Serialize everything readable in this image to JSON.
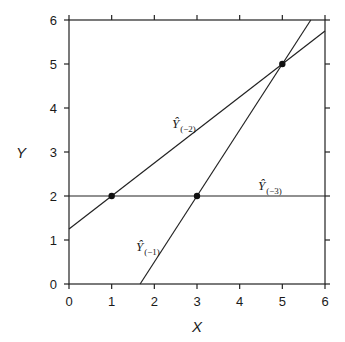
{
  "chart_data": {
    "type": "line",
    "title": "",
    "xlabel": "X",
    "ylabel": "Y",
    "xlim": [
      0,
      6
    ],
    "ylim": [
      0,
      6
    ],
    "x_ticks": [
      "0",
      "1",
      "2",
      "3",
      "4",
      "5",
      "6"
    ],
    "y_ticks": [
      "0",
      "1",
      "2",
      "3",
      "4",
      "5",
      "6"
    ],
    "grid": false,
    "legend": "none (inline labels)",
    "points": [
      {
        "x": 1,
        "y": 2
      },
      {
        "x": 3,
        "y": 2
      },
      {
        "x": 5,
        "y": 5
      }
    ],
    "series": [
      {
        "name": "Ŷ(−1)",
        "label_main": "Ŷ",
        "label_sub": "(−1)",
        "slope": 1.5,
        "intercept": -2.5,
        "through": [
          [
            3,
            2
          ],
          [
            5,
            5
          ]
        ],
        "x_range": [
          1.667,
          5.667
        ]
      },
      {
        "name": "Ŷ(−2)",
        "label_main": "Ŷ",
        "label_sub": "(−2)",
        "slope": 0.75,
        "intercept": 1.25,
        "through": [
          [
            1,
            2
          ],
          [
            5,
            5
          ]
        ],
        "x_range": [
          0,
          6
        ]
      },
      {
        "name": "Ŷ(−3)",
        "label_main": "Ŷ",
        "label_sub": "(−3)",
        "slope": 0,
        "intercept": 2,
        "through": [
          [
            1,
            2
          ],
          [
            3,
            2
          ]
        ],
        "x_range": [
          0,
          6
        ]
      }
    ]
  }
}
